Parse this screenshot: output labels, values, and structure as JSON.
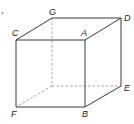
{
  "diagram": {
    "type": "cube",
    "labels": {
      "A": "A",
      "B": "B",
      "C": "C",
      "D": "D",
      "E": "E",
      "F": "F",
      "G": "G"
    },
    "marker": "."
  }
}
